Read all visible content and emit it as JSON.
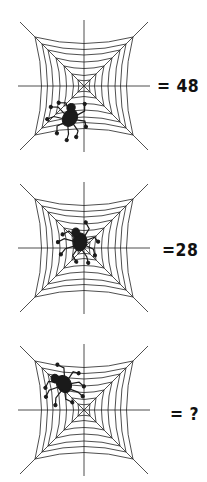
{
  "puzzle": {
    "panels": [
      {
        "spider_position": "bottom-left",
        "label": "= 48"
      },
      {
        "spider_position": "center",
        "label": "=28"
      },
      {
        "spider_position": "upper-left",
        "label": "= ?"
      }
    ],
    "colors": {
      "ink": "#111111",
      "background": "#ffffff"
    }
  }
}
